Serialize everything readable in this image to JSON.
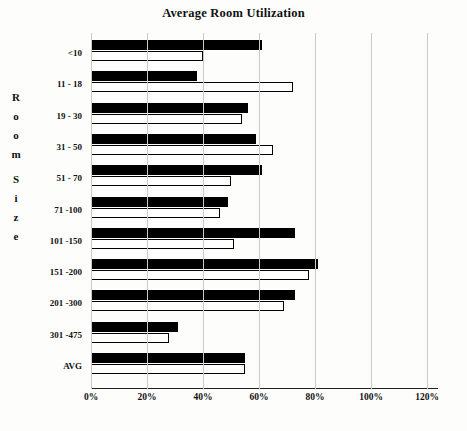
{
  "chart_data": {
    "type": "bar",
    "orientation": "horizontal",
    "title": "Average Room Utilization",
    "xlabel": "",
    "ylabel": "Room Size",
    "xlim": [
      0,
      120
    ],
    "xtick_labels": [
      "0%",
      "20%",
      "40%",
      "60%",
      "80%",
      "100%",
      "120%"
    ],
    "xticks": [
      0,
      20,
      40,
      60,
      80,
      100,
      120
    ],
    "grid": true,
    "legend": "none",
    "categories": [
      "<10",
      "11 - 18",
      "19 - 30",
      "31 - 50",
      "51 - 70",
      "71 -100",
      "101 -150",
      "151 -200",
      "201 -300",
      "301 -475",
      "AVG"
    ],
    "series": [
      {
        "name": "series-dark",
        "style": "filled-black",
        "values": [
          61,
          38,
          56,
          59,
          61,
          49,
          73,
          81,
          73,
          31,
          55
        ]
      },
      {
        "name": "series-light",
        "style": "outlined-white",
        "values": [
          40,
          72,
          54,
          65,
          50,
          46,
          51,
          78,
          69,
          28,
          55
        ]
      }
    ]
  },
  "axis": {
    "y_title_letters": [
      "R",
      "o",
      "o",
      "m",
      "",
      "S",
      "i",
      "z",
      "e"
    ]
  },
  "caption": ""
}
